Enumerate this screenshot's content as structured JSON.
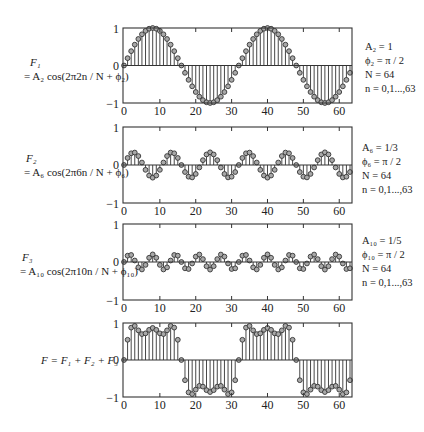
{
  "panels": [
    {
      "id": "F1",
      "label_line1": "F₁",
      "label_line2": "= A₂ cos(2π2n / N + ϕ₂)",
      "params": [
        "A₂ = 1",
        "ϕ₂ = π / 2",
        "N = 64",
        "n = 0,1...,63"
      ],
      "k": 2,
      "amplitude": 1,
      "frame": {
        "top": 28,
        "bottom": 103
      }
    },
    {
      "id": "F2",
      "label_line1": "F₂",
      "label_line2": "= A₆ cos(2π6n / N + ϕ₆)",
      "params": [
        "A₆ = 1/3",
        "ϕ₆ = π / 2",
        "N = 64",
        "n = 0,1...,63"
      ],
      "k": 6,
      "amplitude": 0.3333,
      "frame": {
        "top": 127,
        "bottom": 203
      }
    },
    {
      "id": "F3",
      "label_line1": "F₃",
      "label_line2": "= A₁₀ cos(2π10n / N + ϕ₁₀)",
      "params": [
        "A₁₀ = 1/5",
        "ϕ₁₀ = π / 2",
        "N = 64",
        "n = 0,1...,63"
      ],
      "k": 10,
      "amplitude": 0.2,
      "frame": {
        "top": 224,
        "bottom": 300
      }
    },
    {
      "id": "F",
      "label_line1": "F = F₁ + F₂ + F₃",
      "label_line2": "",
      "params": [],
      "k": null,
      "amplitude": null,
      "frame": {
        "top": 323,
        "bottom": 397
      }
    }
  ],
  "axes": {
    "x_ticks": [
      0,
      10,
      20,
      30,
      40,
      50,
      60
    ],
    "y_ticks": [
      -1,
      0,
      1
    ],
    "xlim": [
      0,
      63
    ],
    "ylim": [
      -1,
      1
    ],
    "frame_left": 123,
    "frame_right": 352
  },
  "colors": {
    "line": "#333333",
    "marker_fill": "#a8a8a8",
    "marker_stroke": "#333333",
    "text": "#222222"
  },
  "chart_data": [
    {
      "type": "stem",
      "title": "F1 = A2 cos(2π2n/N + ϕ2)",
      "xlabel": "n",
      "ylabel": "",
      "xlim": [
        0,
        63
      ],
      "ylim": [
        -1,
        1
      ],
      "x_ticks": [
        0,
        10,
        20,
        30,
        40,
        50,
        60
      ],
      "y_ticks": [
        -1,
        0,
        1
      ],
      "series": [
        {
          "name": "F1",
          "formula": "sin(2π·2n/64)",
          "amplitude": 1,
          "cycles": 2
        }
      ],
      "annotations": [
        "A2 = 1",
        "ϕ2 = π/2",
        "N = 64",
        "n = 0,1...,63"
      ]
    },
    {
      "type": "stem",
      "title": "F2 = A6 cos(2π6n/N + ϕ6)",
      "xlabel": "n",
      "ylabel": "",
      "xlim": [
        0,
        63
      ],
      "ylim": [
        -1,
        1
      ],
      "x_ticks": [
        0,
        10,
        20,
        30,
        40,
        50,
        60
      ],
      "y_ticks": [
        -1,
        0,
        1
      ],
      "series": [
        {
          "name": "F2",
          "formula": "(1/3) sin(2π·6n/64)",
          "amplitude": 0.3333,
          "cycles": 6
        }
      ],
      "annotations": [
        "A6 = 1/3",
        "ϕ6 = π/2",
        "N = 64",
        "n = 0,1...,63"
      ]
    },
    {
      "type": "stem",
      "title": "F3 = A10 cos(2π10n/N + ϕ10)",
      "xlabel": "n",
      "ylabel": "",
      "xlim": [
        0,
        63
      ],
      "ylim": [
        -1,
        1
      ],
      "x_ticks": [
        0,
        10,
        20,
        30,
        40,
        50,
        60
      ],
      "y_ticks": [
        -1,
        0,
        1
      ],
      "series": [
        {
          "name": "F3",
          "formula": "(1/5) sin(2π·10n/64)",
          "amplitude": 0.2,
          "cycles": 10
        }
      ],
      "annotations": [
        "A10 = 1/5",
        "ϕ10 = π/2",
        "N = 64",
        "n = 0,1...,63"
      ]
    },
    {
      "type": "stem",
      "title": "F = F1 + F2 + F3",
      "xlabel": "n",
      "ylabel": "",
      "xlim": [
        0,
        63
      ],
      "ylim": [
        -1,
        1
      ],
      "x_ticks": [
        0,
        10,
        20,
        30,
        40,
        50,
        60
      ],
      "y_ticks": [
        -1,
        0,
        1
      ],
      "series": [
        {
          "name": "F",
          "formula": "F1 + F2 + F3 (square-wave approximation, 2 periods)"
        }
      ]
    }
  ]
}
